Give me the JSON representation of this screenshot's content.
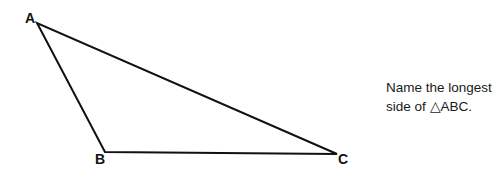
{
  "diagram": {
    "type": "triangle",
    "vertices": [
      {
        "label": "A",
        "x": 37,
        "y": 23
      },
      {
        "label": "B",
        "x": 105,
        "y": 152
      },
      {
        "label": "C",
        "x": 337,
        "y": 154
      }
    ],
    "stroke_color": "#111111"
  },
  "question": {
    "line1": "Name the longest",
    "line2_prefix": "side of ",
    "triangle_symbol": "△",
    "line2_suffix": "ABC."
  }
}
